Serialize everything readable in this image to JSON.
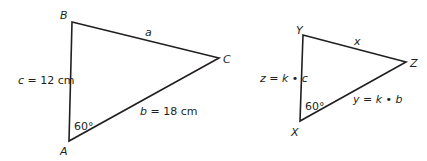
{
  "triangle_abc": {
    "vertices": {
      "A": {
        "label": "A",
        "x": 69,
        "y": 141
      },
      "B": {
        "label": "B",
        "x": 72,
        "y": 22
      },
      "C": {
        "label": "C",
        "x": 219,
        "y": 58
      }
    },
    "sides": {
      "a": "a",
      "b": "b = 18 cm",
      "c": "c = 12 cm"
    },
    "angle_A": "60°"
  },
  "triangle_xyz": {
    "vertices": {
      "X": {
        "label": "X",
        "x": 300,
        "y": 121
      },
      "Y": {
        "label": "Y",
        "x": 303,
        "y": 35
      },
      "Z": {
        "label": "Z",
        "x": 406,
        "y": 62
      }
    },
    "sides": {
      "x": "x",
      "y": "y = k • b",
      "z": "z = k • c"
    },
    "angle_X": "60°"
  },
  "colors": {
    "stroke": "#231f20",
    "background": "#ffffff"
  }
}
